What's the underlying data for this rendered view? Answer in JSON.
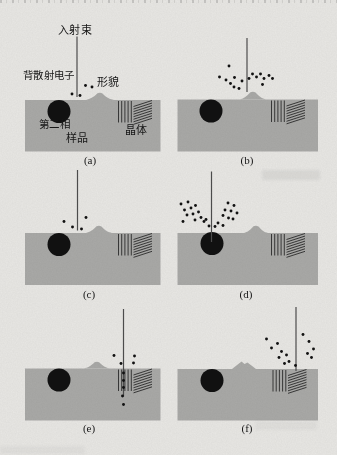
{
  "colors": {
    "paper": "#e8e7e4",
    "sample_gray": "#a9a9a7",
    "ink": "#111111",
    "beam": "#4d4d4d",
    "hatch": "#2b2b2b"
  },
  "labels": {
    "incident_beam": "入射束",
    "backscattered_electrons": "背散射电子",
    "topography": "形貌",
    "second_phase": "第二相",
    "sample": "样品",
    "crystal": "晶体"
  },
  "panels": [
    {
      "id": "a",
      "caption": "(a)",
      "block": {
        "x": 25,
        "y": 100,
        "w": 135.5,
        "h": 51.5
      },
      "circle": {
        "cx": 59,
        "cy": 111.5,
        "r": 11.5
      },
      "bump": {
        "type": "round",
        "cx": 100,
        "h": 7.5,
        "hw": 14,
        "ys": 100
      },
      "hatch": {
        "x": 118.5,
        "y": 101
      },
      "beam": {
        "x": 77,
        "y1": 36.5,
        "y2": 97
      },
      "dots": [
        [
          72,
          94
        ],
        [
          80,
          95.5
        ],
        [
          85.5,
          85.5
        ],
        [
          92,
          87
        ]
      ]
    },
    {
      "id": "b",
      "caption": "(b)",
      "block": {
        "x": 177.5,
        "y": 99.5,
        "w": 140.5,
        "h": 52
      },
      "circle": {
        "cx": 211,
        "cy": 111,
        "r": 11.5
      },
      "bump": {
        "type": "round",
        "cx": 253,
        "h": 8,
        "hw": 13,
        "ys": 99.5
      },
      "hatch": {
        "x": 271.5,
        "y": 100.5
      },
      "beam": {
        "x": 247,
        "y1": 38,
        "y2": 92
      },
      "dots": [
        [
          229,
          66
        ],
        [
          219.5,
          77
        ],
        [
          226,
          80
        ],
        [
          230.5,
          83.5
        ],
        [
          234,
          87
        ],
        [
          234.5,
          77.5
        ],
        [
          239,
          88.5
        ],
        [
          242,
          81
        ],
        [
          249,
          78.5
        ],
        [
          252.5,
          74
        ],
        [
          256.5,
          77
        ],
        [
          260.5,
          74
        ],
        [
          264,
          78.5
        ],
        [
          269,
          75.5
        ],
        [
          272.5,
          78.5
        ],
        [
          262.5,
          84.5
        ]
      ]
    },
    {
      "id": "c",
      "caption": "(c)",
      "block": {
        "x": 25,
        "y": 233,
        "w": 135.5,
        "h": 52
      },
      "circle": {
        "cx": 59,
        "cy": 244.5,
        "r": 11.5
      },
      "bump": {
        "type": "round",
        "cx": 99,
        "h": 7.5,
        "hw": 13,
        "ys": 233
      },
      "hatch": {
        "x": 118.5,
        "y": 234
      },
      "beam": {
        "x": 77.5,
        "y1": 170,
        "y2": 230.5
      },
      "dots": [
        [
          64,
          221.5
        ],
        [
          72.5,
          227
        ],
        [
          81.5,
          229
        ],
        [
          86,
          217.5
        ]
      ]
    },
    {
      "id": "d",
      "caption": "(d)",
      "block": {
        "x": 177.5,
        "y": 233,
        "w": 140.5,
        "h": 52
      },
      "circle": {
        "cx": 212,
        "cy": 243.5,
        "r": 11.5
      },
      "bump": {
        "type": "round",
        "cx": 256,
        "h": 7.5,
        "hw": 12,
        "ys": 233
      },
      "hatch": {
        "x": 271.5,
        "y": 234
      },
      "beam": {
        "x": 211.5,
        "y1": 171.5,
        "y2": 242
      },
      "dots": [
        [
          181,
          204
        ],
        [
          188,
          202
        ],
        [
          184.5,
          210
        ],
        [
          191,
          208
        ],
        [
          195.5,
          205.5
        ],
        [
          187,
          215
        ],
        [
          193,
          214
        ],
        [
          198.5,
          212
        ],
        [
          201,
          217.5
        ],
        [
          195,
          220
        ],
        [
          204,
          221.5
        ],
        [
          183,
          221.5
        ],
        [
          228,
          203
        ],
        [
          234,
          205.5
        ],
        [
          225,
          210
        ],
        [
          231,
          211
        ],
        [
          237,
          213
        ],
        [
          223,
          215.5
        ],
        [
          228.5,
          218
        ],
        [
          233,
          219
        ],
        [
          218,
          223
        ],
        [
          223,
          225.5
        ],
        [
          215,
          226.5
        ],
        [
          209,
          226
        ],
        [
          206,
          219.5
        ]
      ]
    },
    {
      "id": "e",
      "caption": "(e)",
      "block": {
        "x": 25,
        "y": 368.5,
        "w": 135.5,
        "h": 52
      },
      "circle": {
        "cx": 59,
        "cy": 380,
        "r": 11.5
      },
      "bump": {
        "type": "round",
        "cx": 97,
        "h": 7,
        "hw": 13,
        "ys": 368.5
      },
      "hatch": {
        "x": 118.5,
        "y": 369.5
      },
      "beam": {
        "x": 123.5,
        "y1": 309,
        "y2": 396.5
      },
      "dots": [
        [
          114,
          355.5
        ],
        [
          134.5,
          356
        ],
        [
          121,
          363.5
        ],
        [
          133.5,
          363
        ],
        [
          123.5,
          373
        ],
        [
          123.5,
          380.5
        ],
        [
          123.5,
          387.5
        ],
        [
          122.5,
          396
        ],
        [
          123.5,
          404.5
        ]
      ]
    },
    {
      "id": "f",
      "caption": "(f)",
      "block": {
        "x": 177.5,
        "y": 369,
        "w": 140.5,
        "h": 51.5
      },
      "circle": {
        "cx": 212,
        "cy": 380.5,
        "r": 11.5
      },
      "bump": {
        "type": "peaked",
        "points": [
          [
            232,
            369
          ],
          [
            241.5,
            361.5
          ],
          [
            244.5,
            364
          ],
          [
            247.5,
            362.5
          ],
          [
            256,
            369
          ]
        ],
        "ys": 369
      },
      "hatch": {
        "x": 273,
        "y": 370
      },
      "beam": {
        "x": 296,
        "y1": 307,
        "y2": 371
      },
      "dots": [
        [
          266.5,
          339
        ],
        [
          271.5,
          348
        ],
        [
          277.5,
          343.5
        ],
        [
          281.5,
          351.5
        ],
        [
          279,
          357.5
        ],
        [
          286.5,
          355
        ],
        [
          289,
          361.5
        ],
        [
          284.5,
          363.5
        ],
        [
          295.5,
          365.5
        ],
        [
          303,
          334.5
        ],
        [
          309,
          341.5
        ],
        [
          313.5,
          349
        ],
        [
          307.5,
          353.5
        ],
        [
          311.5,
          357.5
        ]
      ]
    }
  ]
}
